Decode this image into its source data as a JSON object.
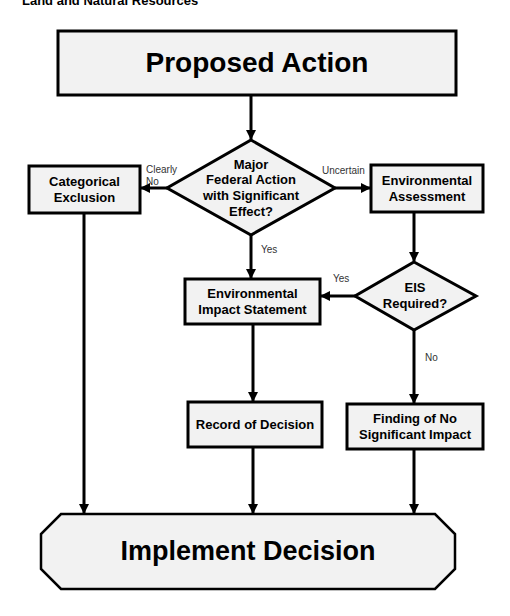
{
  "header": {
    "text": "Land and Natural Resources"
  },
  "colors": {
    "box_fill": "#f2f2f2",
    "stroke": "#000000",
    "background": "#ffffff"
  },
  "nodes": {
    "proposed_action": {
      "label": "Proposed Action",
      "shape": "rectangle"
    },
    "major_federal_action": {
      "label_lines": [
        "Major",
        "Federal Action",
        "with Significant",
        "Effect?"
      ],
      "shape": "diamond"
    },
    "categorical_exclusion": {
      "label_lines": [
        "Categorical",
        "Exclusion"
      ],
      "shape": "rectangle"
    },
    "environmental_assessment": {
      "label_lines": [
        "Environmental",
        "Assessment"
      ],
      "shape": "rectangle"
    },
    "eis_required": {
      "label_lines": [
        "EIS",
        "Required?"
      ],
      "shape": "diamond"
    },
    "environmental_impact_statement": {
      "label_lines": [
        "Environmental",
        "Impact Statement"
      ],
      "shape": "rectangle"
    },
    "record_of_decision": {
      "label": "Record of Decision",
      "shape": "rectangle"
    },
    "fonsi": {
      "label_lines": [
        "Finding of No",
        "Significant Impact"
      ],
      "shape": "rectangle"
    },
    "implement_decision": {
      "label": "Implement Decision",
      "shape": "octagon"
    }
  },
  "edges": [
    {
      "from": "proposed_action",
      "to": "major_federal_action",
      "label": ""
    },
    {
      "from": "major_federal_action",
      "to": "categorical_exclusion",
      "label_lines": [
        "Clearly",
        "No"
      ]
    },
    {
      "from": "major_federal_action",
      "to": "environmental_assessment",
      "label": "Uncertain"
    },
    {
      "from": "major_federal_action",
      "to": "environmental_impact_statement",
      "label": "Yes"
    },
    {
      "from": "environmental_assessment",
      "to": "eis_required",
      "label": ""
    },
    {
      "from": "eis_required",
      "to": "environmental_impact_statement",
      "label": "Yes"
    },
    {
      "from": "eis_required",
      "to": "fonsi",
      "label": "No"
    },
    {
      "from": "environmental_impact_statement",
      "to": "record_of_decision",
      "label": ""
    },
    {
      "from": "categorical_exclusion",
      "to": "implement_decision",
      "label": ""
    },
    {
      "from": "record_of_decision",
      "to": "implement_decision",
      "label": ""
    },
    {
      "from": "fonsi",
      "to": "implement_decision",
      "label": ""
    }
  ]
}
